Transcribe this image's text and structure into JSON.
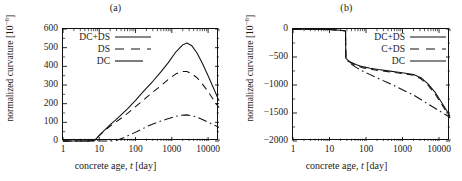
{
  "figure": {
    "panels": [
      {
        "key": "a",
        "panel_label": "(a)",
        "chart_data": {
          "type": "line",
          "title": "(a)",
          "xlabel": "concrete age, t [day]",
          "ylabel": "normalized curvature [10^-6]",
          "xscale": "log",
          "xlim": [
            1,
            20000
          ],
          "ylim": [
            0,
            600
          ],
          "xticks": [
            1,
            10,
            100,
            1000,
            10000
          ],
          "xticklabels": [
            "1",
            "10",
            "100",
            "1000",
            "10000"
          ],
          "yticks": [
            0,
            100,
            200,
            300,
            400,
            500,
            600
          ],
          "yticklabels": [
            "0",
            "100",
            "200",
            "300",
            "400",
            "500",
            "600"
          ],
          "grid": false,
          "legend_position": "upper-left",
          "series": [
            {
              "name": "DC+DS",
              "style": "solid",
              "x": [
                1,
                5,
                7,
                8,
                10,
                14,
                20,
                28,
                40,
                60,
                100,
                170,
                300,
                500,
                800,
                1300,
                2000,
                2600,
                3500,
                5000,
                7000,
                10000,
                14000,
                20000
              ],
              "values": [
                0,
                0,
                2,
                10,
                30,
                58,
                88,
                112,
                140,
                172,
                218,
                268,
                320,
                370,
                420,
                478,
                515,
                525,
                512,
                470,
                415,
                350,
                285,
                215
              ]
            },
            {
              "name": "DS",
              "style": "dashed",
              "x": [
                1,
                5,
                7,
                8,
                10,
                14,
                20,
                28,
                40,
                60,
                100,
                170,
                300,
                500,
                800,
                1300,
                2000,
                2600,
                3500,
                5000,
                7000,
                10000,
                14000,
                20000
              ],
              "values": [
                0,
                0,
                2,
                10,
                29,
                55,
                80,
                100,
                122,
                148,
                184,
                222,
                262,
                296,
                330,
                360,
                372,
                372,
                362,
                338,
                305,
                265,
                222,
                178
              ]
            },
            {
              "name": "DC",
              "style": "dashdot",
              "x": [
                1,
                20,
                28,
                35,
                50,
                80,
                130,
                220,
                400,
                700,
                1200,
                1800,
                2600,
                3500,
                5000,
                7000,
                10000,
                14000,
                20000
              ],
              "values": [
                0,
                0,
                2,
                8,
                20,
                38,
                58,
                80,
                100,
                116,
                130,
                138,
                140,
                136,
                128,
                115,
                100,
                88,
                72
              ]
            }
          ]
        }
      },
      {
        "key": "b",
        "panel_label": "(b)",
        "chart_data": {
          "type": "line",
          "title": "(b)",
          "xlabel": "concrete age, t [day]",
          "ylabel": "normalized curvature [10^-6]",
          "xscale": "log",
          "xlim": [
            1,
            20000
          ],
          "ylim": [
            -2000,
            0
          ],
          "xticks": [
            1,
            10,
            100,
            1000,
            10000
          ],
          "xticklabels": [
            "1",
            "10",
            "100",
            "1000",
            "10000"
          ],
          "yticks": [
            0,
            -500,
            -1000,
            -1500,
            -2000
          ],
          "yticklabels": [
            "0",
            "-500",
            "-1000",
            "-1500",
            "-2000"
          ],
          "grid": false,
          "legend_position": "upper-right",
          "series": [
            {
              "name": "DC+DS",
              "style": "solid",
              "x": [
                1,
                5,
                10,
                15,
                20,
                25,
                27.5,
                28,
                32,
                40,
                55,
                80,
                130,
                220,
                400,
                700,
                1200,
                2000,
                3200,
                5000,
                8000,
                12000,
                16000,
                20000
              ],
              "values": [
                -5,
                -6,
                -10,
                -16,
                -24,
                -32,
                -36,
                -520,
                -560,
                -600,
                -640,
                -672,
                -700,
                -725,
                -748,
                -768,
                -790,
                -812,
                -870,
                -980,
                -1140,
                -1320,
                -1450,
                -1560
              ]
            },
            {
              "name": "C+DS",
              "style": "dashed",
              "x": [
                1,
                5,
                10,
                15,
                20,
                25,
                27.5,
                28,
                32,
                40,
                55,
                80,
                130,
                220,
                400,
                700,
                1200,
                2000,
                3200,
                5000,
                8000,
                12000,
                16000,
                20000
              ],
              "values": [
                -5,
                -6,
                -10,
                -16,
                -24,
                -32,
                -36,
                -520,
                -566,
                -612,
                -655,
                -690,
                -718,
                -742,
                -762,
                -782,
                -802,
                -826,
                -890,
                -1005,
                -1170,
                -1350,
                -1480,
                -1590
              ]
            },
            {
              "name": "DC",
              "style": "dashdot",
              "x": [
                1,
                5,
                10,
                15,
                20,
                25,
                27.5,
                28,
                32,
                40,
                55,
                80,
                130,
                220,
                400,
                700,
                1200,
                2000,
                3200,
                5000,
                8000,
                12000,
                16000,
                20000
              ],
              "values": [
                -5,
                -6,
                -10,
                -16,
                -24,
                -32,
                -36,
                -520,
                -575,
                -630,
                -690,
                -750,
                -815,
                -885,
                -960,
                -1035,
                -1110,
                -1180,
                -1260,
                -1340,
                -1420,
                -1490,
                -1540,
                -1580
              ]
            }
          ]
        }
      }
    ]
  }
}
